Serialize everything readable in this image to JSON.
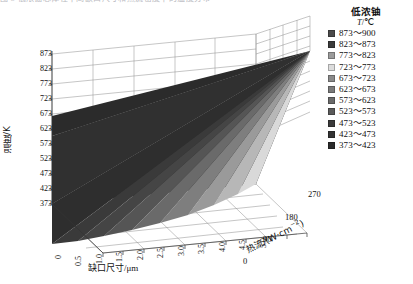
{
  "top_cut_text": "图 5  低浓铀芯体在不同缺口尺寸和热流密度下的温度分布",
  "legend": {
    "title": "低浓铀",
    "unit_symbol": "T",
    "unit_value": "/℃",
    "entries": [
      {
        "label": "873～900",
        "color": "#4a4a4a"
      },
      {
        "label": "823～873",
        "color": "#3b3b3b"
      },
      {
        "label": "773～823",
        "color": "#9b9b9b"
      },
      {
        "label": "723～773",
        "color": "#dcdcdc"
      },
      {
        "label": "673～723",
        "color": "#8a8a8a"
      },
      {
        "label": "623～673",
        "color": "#7a7a7a"
      },
      {
        "label": "573～623",
        "color": "#6a6a6a"
      },
      {
        "label": "523～573",
        "color": "#5a5a5a"
      },
      {
        "label": "473～523",
        "color": "#3a3a3a"
      },
      {
        "label": "423～473",
        "color": "#333333"
      },
      {
        "label": "373～423",
        "color": "#2b2b2b"
      }
    ]
  },
  "axes": {
    "y": {
      "title": "温度/K",
      "ticks": [
        "873",
        "823",
        "773",
        "723",
        "673",
        "623",
        "573",
        "523",
        "473",
        "423",
        "373"
      ]
    },
    "x": {
      "title_cn": "缺口尺寸",
      "title_unit": "/μm",
      "ticks": [
        "0",
        "0.5",
        "1.0",
        "1.5",
        "2.0",
        "2.5",
        "3.0",
        "3.5",
        "4.0",
        "4.5",
        "5.0"
      ]
    },
    "z": {
      "title_cn": "热流",
      "title_unit": "/(W·cm",
      "title_exp": "−2",
      "title_tail": ")",
      "ticks": [
        "0",
        "90",
        "180",
        "270"
      ]
    }
  },
  "chart_data": {
    "type": "surface",
    "title": "",
    "xlabel": "缺口尺寸/μm",
    "ylabel": "温度/K",
    "zlabel": "热流/(W·cm−2)",
    "xlim": [
      0,
      5.0
    ],
    "ylim": [
      373,
      900
    ],
    "zlim": [
      0,
      270
    ],
    "x": [
      0,
      0.5,
      1.0,
      1.5,
      2.0,
      2.5,
      3.0,
      3.5,
      4.0,
      4.5,
      5.0
    ],
    "z": [
      0,
      90,
      180,
      270
    ],
    "grid": true,
    "legend_position": "right",
    "band_edges": [
      373,
      423,
      473,
      523,
      573,
      623,
      673,
      723,
      773,
      823,
      873,
      900
    ],
    "series": [
      {
        "name": "q=0 W·cm−2",
        "values": [
          373,
          373,
          373,
          373,
          373,
          373,
          373,
          373,
          373,
          373,
          373
        ]
      },
      {
        "name": "q=90 W·cm−2",
        "values": [
          560,
          556,
          551,
          545,
          538,
          530,
          520,
          508,
          494,
          477,
          458
        ]
      },
      {
        "name": "q=180 W·cm−2",
        "values": [
          730,
          723,
          715,
          706,
          695,
          682,
          667,
          650,
          630,
          607,
          580
        ]
      },
      {
        "name": "q=270 W·cm−2",
        "values": [
          900,
          890,
          879,
          866,
          852,
          836,
          818,
          797,
          773,
          745,
          713
        ]
      }
    ]
  }
}
